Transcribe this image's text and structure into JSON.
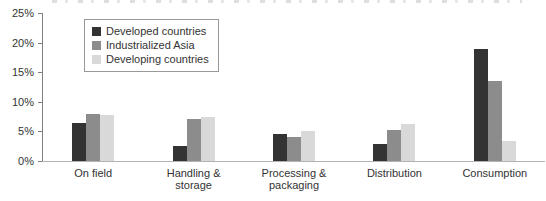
{
  "chart_data": {
    "type": "bar",
    "title": "",
    "categories": [
      "On field",
      "Handling & storage",
      "Processing & packaging",
      "Distribution",
      "Consumption"
    ],
    "series": [
      {
        "name": "Developed countries",
        "color": "#333333",
        "values": [
          6.5,
          2.6,
          4.6,
          2.9,
          19.0
        ]
      },
      {
        "name": "Industrialized Asia",
        "color": "#8c8c8c",
        "values": [
          8.0,
          7.1,
          4.0,
          5.3,
          13.6
        ]
      },
      {
        "name": "Developing countries",
        "color": "#d9d9d9",
        "values": [
          7.7,
          7.4,
          5.1,
          6.2,
          3.4
        ]
      }
    ],
    "ylabel": "",
    "xlabel": "",
    "ylim": [
      0,
      25
    ],
    "ytick_step": 5,
    "ytick_labels": [
      "25%",
      "20%",
      "15%",
      "10%",
      "5%",
      "0%"
    ],
    "grid": false,
    "legend_position": "inside-top-left"
  },
  "style": {
    "axis_color": "#7f7f7f",
    "baseline_color": "#b3b3b3",
    "text_color": "#333333",
    "legend_border_color": "#999999"
  }
}
